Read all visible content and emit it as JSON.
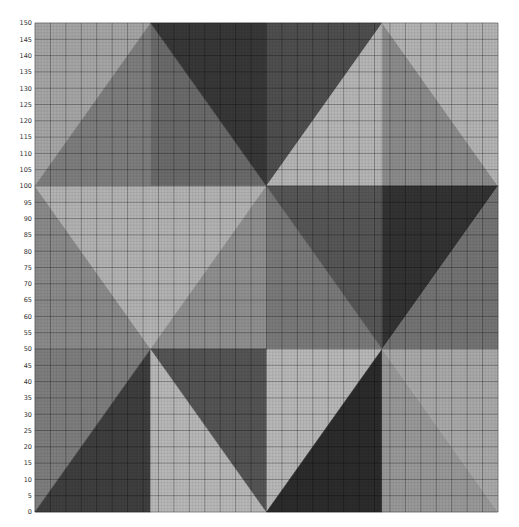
{
  "chart_data": {
    "type": "heatmap",
    "title": "",
    "xlabel": "",
    "ylabel": "",
    "xlim": [
      0,
      150
    ],
    "ylim": [
      0,
      150
    ],
    "grid": {
      "minor_step": 1,
      "major_step": 5,
      "visible": true
    },
    "y_ticks": [
      0,
      5,
      10,
      15,
      20,
      25,
      30,
      35,
      40,
      45,
      50,
      55,
      60,
      65,
      70,
      75,
      80,
      85,
      90,
      95,
      100,
      105,
      110,
      115,
      120,
      125,
      130,
      135,
      140,
      145,
      150
    ],
    "x_ticks": [],
    "regions": [
      {
        "name": "top-col0-upper-left",
        "color": "#a6a6a6",
        "points": [
          [
            0,
            100
          ],
          [
            0,
            150
          ],
          [
            37.5,
            150
          ]
        ]
      },
      {
        "name": "top-col0-lower-right",
        "color": "#7e7e7e",
        "points": [
          [
            0,
            100
          ],
          [
            37.5,
            150
          ],
          [
            37.5,
            100
          ]
        ]
      },
      {
        "name": "top-col1-lower-left",
        "color": "#6b6b6b",
        "points": [
          [
            37.5,
            100
          ],
          [
            37.5,
            150
          ],
          [
            75,
            100
          ]
        ]
      },
      {
        "name": "top-col1-upper-right",
        "color": "#383838",
        "points": [
          [
            37.5,
            150
          ],
          [
            75,
            150
          ],
          [
            75,
            100
          ]
        ]
      },
      {
        "name": "top-col2-upper-left",
        "color": "#4f4f4f",
        "points": [
          [
            75,
            100
          ],
          [
            75,
            150
          ],
          [
            112.5,
            150
          ]
        ]
      },
      {
        "name": "top-col2-lower-right",
        "color": "#b6b6b6",
        "points": [
          [
            75,
            100
          ],
          [
            112.5,
            150
          ],
          [
            112.5,
            100
          ]
        ]
      },
      {
        "name": "top-col3-left",
        "color": "#8c8c8c",
        "points": [
          [
            112.5,
            100
          ],
          [
            112.5,
            150
          ],
          [
            150,
            100
          ]
        ]
      },
      {
        "name": "top-col3-upper-right",
        "color": "#b4b4b4",
        "points": [
          [
            112.5,
            150
          ],
          [
            150,
            150
          ],
          [
            150,
            100
          ]
        ]
      },
      {
        "name": "mid-col0-lower-left",
        "color": "#8b8b8b",
        "points": [
          [
            0,
            50
          ],
          [
            0,
            100
          ],
          [
            37.5,
            50
          ]
        ]
      },
      {
        "name": "mid-col0-upper-right",
        "color": "#b3b3b3",
        "points": [
          [
            0,
            100
          ],
          [
            37.5,
            100
          ],
          [
            37.5,
            50
          ]
        ]
      },
      {
        "name": "mid-col1-upper-left",
        "color": "#b3b3b3",
        "points": [
          [
            37.5,
            50
          ],
          [
            37.5,
            100
          ],
          [
            75,
            100
          ]
        ]
      },
      {
        "name": "mid-col1-lower-right",
        "color": "#909090",
        "points": [
          [
            37.5,
            50
          ],
          [
            75,
            100
          ],
          [
            75,
            50
          ]
        ]
      },
      {
        "name": "mid-col2-lower-left",
        "color": "#7a7a7a",
        "points": [
          [
            75,
            50
          ],
          [
            75,
            100
          ],
          [
            112.5,
            50
          ]
        ]
      },
      {
        "name": "mid-col2-upper-right",
        "color": "#575757",
        "points": [
          [
            75,
            100
          ],
          [
            112.5,
            100
          ],
          [
            112.5,
            50
          ]
        ]
      },
      {
        "name": "mid-col3-upper-left",
        "color": "#333333",
        "points": [
          [
            112.5,
            50
          ],
          [
            112.5,
            100
          ],
          [
            150,
            100
          ]
        ]
      },
      {
        "name": "mid-col3-lower-right",
        "color": "#747474",
        "points": [
          [
            112.5,
            50
          ],
          [
            150,
            100
          ],
          [
            150,
            50
          ]
        ]
      },
      {
        "name": "bot-col0-upper-left",
        "color": "#7e7e7e",
        "points": [
          [
            0,
            0
          ],
          [
            0,
            50
          ],
          [
            37.5,
            50
          ]
        ]
      },
      {
        "name": "bot-col0-lower-right",
        "color": "#3f3f3f",
        "points": [
          [
            0,
            0
          ],
          [
            37.5,
            50
          ],
          [
            37.5,
            0
          ]
        ]
      },
      {
        "name": "bot-col1-lower-left",
        "color": "#b8b8b8",
        "points": [
          [
            37.5,
            0
          ],
          [
            37.5,
            50
          ],
          [
            75,
            0
          ]
        ]
      },
      {
        "name": "bot-col1-upper-right",
        "color": "#555555",
        "points": [
          [
            37.5,
            50
          ],
          [
            75,
            50
          ],
          [
            75,
            0
          ]
        ]
      },
      {
        "name": "bot-col2-upper-left",
        "color": "#b8b8b8",
        "points": [
          [
            75,
            0
          ],
          [
            75,
            50
          ],
          [
            112.5,
            50
          ]
        ]
      },
      {
        "name": "bot-col2-lower-right",
        "color": "#2c2c2c",
        "points": [
          [
            75,
            0
          ],
          [
            112.5,
            50
          ],
          [
            112.5,
            0
          ]
        ]
      },
      {
        "name": "bot-col3-lower-left",
        "color": "#999999",
        "points": [
          [
            112.5,
            0
          ],
          [
            112.5,
            50
          ],
          [
            150,
            0
          ]
        ]
      },
      {
        "name": "bot-col3-upper-right",
        "color": "#a9a9a9",
        "points": [
          [
            112.5,
            50
          ],
          [
            150,
            50
          ],
          [
            150,
            0
          ]
        ]
      }
    ]
  },
  "layout": {
    "plot_left": 35,
    "plot_top": 23,
    "plot_right": 498,
    "plot_bottom": 512,
    "minor_grid_color": "#000000",
    "minor_grid_opacity": 0.12,
    "major_grid_color": "#000000",
    "major_grid_opacity": 0.45
  }
}
